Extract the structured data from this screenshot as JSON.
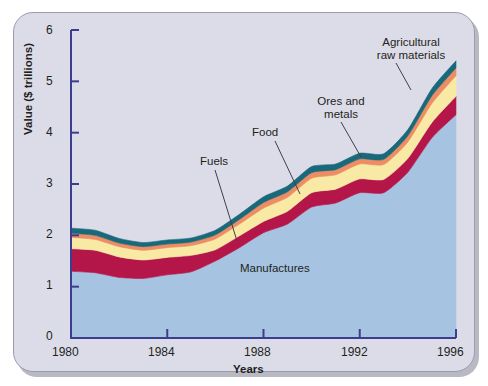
{
  "figure": {
    "background_color": "#dcdce8",
    "frame_border_color": "#9b9bae"
  },
  "chart_data": {
    "type": "area",
    "stacked": true,
    "title": "",
    "xlabel": "Years",
    "ylabel": "Value ($ trillions)",
    "xlim": [
      1980,
      1996
    ],
    "ylim": [
      0,
      6
    ],
    "grid": false,
    "legend_position": "inline-annotations",
    "x_ticks": [
      "1980",
      "1984",
      "1988",
      "1992",
      "1996"
    ],
    "y_ticks": [
      "0",
      "1",
      "2",
      "3",
      "4",
      "5",
      "6"
    ],
    "x": [
      1980,
      1981,
      1982,
      1983,
      1984,
      1985,
      1986,
      1987,
      1988,
      1989,
      1990,
      1991,
      1992,
      1993,
      1994,
      1995,
      1996
    ],
    "series": [
      {
        "name": "Manufactures",
        "color": "#a6c4e2",
        "values": [
          1.3,
          1.27,
          1.18,
          1.16,
          1.23,
          1.29,
          1.5,
          1.76,
          2.05,
          2.22,
          2.55,
          2.63,
          2.83,
          2.83,
          3.23,
          3.9,
          4.35
        ]
      },
      {
        "name": "Fuels",
        "color": "#b5164a",
        "values": [
          0.44,
          0.44,
          0.4,
          0.36,
          0.34,
          0.32,
          0.22,
          0.23,
          0.22,
          0.25,
          0.28,
          0.27,
          0.27,
          0.26,
          0.27,
          0.3,
          0.36
        ]
      },
      {
        "name": "Food",
        "color": "#f8e9a4",
        "values": [
          0.22,
          0.21,
          0.2,
          0.19,
          0.19,
          0.19,
          0.21,
          0.23,
          0.26,
          0.27,
          0.28,
          0.28,
          0.29,
          0.29,
          0.32,
          0.37,
          0.4
        ]
      },
      {
        "name": "Ores and metals",
        "color": "#ee8d63",
        "values": [
          0.08,
          0.08,
          0.07,
          0.07,
          0.07,
          0.07,
          0.08,
          0.09,
          0.11,
          0.11,
          0.11,
          0.1,
          0.1,
          0.1,
          0.12,
          0.15,
          0.15
        ]
      },
      {
        "name": "Agricultural raw materials",
        "color": "#19697a",
        "values": [
          0.1,
          0.1,
          0.09,
          0.08,
          0.08,
          0.08,
          0.09,
          0.1,
          0.11,
          0.11,
          0.12,
          0.11,
          0.11,
          0.11,
          0.12,
          0.14,
          0.14
        ]
      }
    ],
    "annotations": [
      {
        "label": "Fuels",
        "target_series": "Fuels"
      },
      {
        "label": "Food",
        "target_series": "Food"
      },
      {
        "label": "Ores and\nmetals",
        "target_series": "Ores and metals"
      },
      {
        "label": "Agricultural\nraw materials",
        "target_series": "Agricultural raw materials"
      },
      {
        "label": "Manufactures",
        "target_series": "Manufactures"
      }
    ]
  },
  "labels": {
    "y_axis_title": "Value ($ trillions)",
    "x_axis_title": "Years",
    "fuels": "Fuels",
    "food": "Food",
    "ores_line1": "Ores and",
    "ores_line2": "metals",
    "agri_line1": "Agricultural",
    "agri_line2": "raw materials",
    "manufactures": "Manufactures",
    "ytick_0": "0",
    "ytick_1": "1",
    "ytick_2": "2",
    "ytick_3": "3",
    "ytick_4": "4",
    "ytick_5": "5",
    "ytick_6": "6",
    "xtick_1980": "1980",
    "xtick_1984": "1984",
    "xtick_1988": "1988",
    "xtick_1992": "1992",
    "xtick_1996": "1996"
  }
}
